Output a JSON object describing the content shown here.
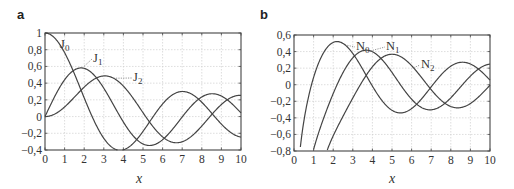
{
  "chart_data": [
    {
      "panel": "a",
      "type": "line",
      "title": "",
      "xlabel": "x",
      "ylabel": "",
      "xlim": [
        0,
        10
      ],
      "ylim": [
        -0.4,
        1
      ],
      "grid": true,
      "x_ticks": [
        "0",
        "1",
        "2",
        "3",
        "4",
        "5",
        "6",
        "7",
        "8",
        "9",
        "10"
      ],
      "y_ticks": [
        "1",
        "0,8",
        "0,6",
        "0,4",
        "0,2",
        "0",
        "−0,2",
        "−0,4"
      ],
      "series": [
        {
          "name": "J0",
          "label_main": "J",
          "label_sub": "0",
          "x": [
            0,
            1,
            2,
            3,
            4,
            5,
            6,
            7,
            8,
            9,
            10
          ],
          "values": [
            1.0,
            0.765,
            0.224,
            -0.26,
            -0.397,
            -0.178,
            0.151,
            0.3,
            0.172,
            -0.09,
            -0.246
          ]
        },
        {
          "name": "J1",
          "label_main": "J",
          "label_sub": "1",
          "x": [
            0,
            1,
            2,
            3,
            4,
            5,
            6,
            7,
            8,
            9,
            10
          ],
          "values": [
            0.0,
            0.44,
            0.577,
            0.339,
            -0.066,
            -0.328,
            -0.277,
            -0.005,
            0.235,
            0.245,
            0.043
          ]
        },
        {
          "name": "J2",
          "label_main": "J",
          "label_sub": "2",
          "x": [
            0,
            1,
            2,
            3,
            4,
            5,
            6,
            7,
            8,
            9,
            10
          ],
          "values": [
            0.0,
            0.115,
            0.353,
            0.486,
            0.364,
            0.047,
            -0.243,
            -0.301,
            -0.113,
            0.145,
            0.255
          ]
        }
      ]
    },
    {
      "panel": "b",
      "type": "line",
      "title": "",
      "xlabel": "x",
      "ylabel": "",
      "xlim": [
        0,
        10
      ],
      "ylim": [
        -0.8,
        0.6
      ],
      "grid": true,
      "x_ticks": [
        "0",
        "1",
        "2",
        "3",
        "4",
        "5",
        "6",
        "7",
        "8",
        "9",
        "10"
      ],
      "y_ticks": [
        "0,6",
        "0,4",
        "0,2",
        "0",
        "−0,2",
        "−0,4",
        "−0,6",
        "−0,8"
      ],
      "series": [
        {
          "name": "N0",
          "label_main": "N",
          "label_sub": "0",
          "x": [
            0.3,
            1,
            2,
            3,
            4,
            5,
            6,
            7,
            8,
            9,
            10
          ],
          "values": [
            -0.8,
            0.088,
            0.51,
            0.377,
            -0.017,
            -0.309,
            -0.288,
            -0.026,
            0.223,
            0.25,
            0.056
          ]
        },
        {
          "name": "N1",
          "label_main": "N",
          "label_sub": "1",
          "x": [
            1,
            2,
            3,
            4,
            5,
            6,
            7,
            8,
            9,
            10
          ],
          "values": [
            -0.781,
            -0.107,
            0.325,
            0.398,
            0.148,
            -0.175,
            -0.303,
            -0.158,
            0.104,
            0.249
          ]
        },
        {
          "name": "N2",
          "label_main": "N",
          "label_sub": "2",
          "x": [
            1.7,
            2,
            3,
            4,
            5,
            6,
            7,
            8,
            9,
            10
          ],
          "values": [
            -0.8,
            -0.617,
            -0.16,
            0.215,
            0.368,
            0.23,
            -0.061,
            -0.264,
            -0.227,
            -0.006
          ]
        }
      ]
    }
  ],
  "panels": {
    "a": {
      "label": "a",
      "xlabel": "x"
    },
    "b": {
      "label": "b",
      "xlabel": "x"
    }
  }
}
